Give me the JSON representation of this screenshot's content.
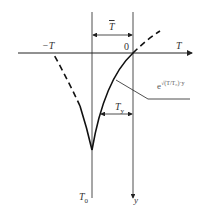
{
  "diagram": {
    "labels": {
      "neg_T": "−T",
      "origin": "0",
      "T_axis": "T",
      "T_bar": "T",
      "T_y": "T",
      "T_y_sub": "y",
      "T_0": "T",
      "T_0_sub": "0",
      "y_axis": "y",
      "curve_base": "e",
      "curve_exponent": "√(T/T₀)·y"
    },
    "colors": {
      "line": "#222222",
      "text": "#333333",
      "background": "#ffffff"
    }
  }
}
